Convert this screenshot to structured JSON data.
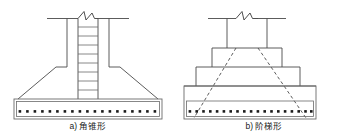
{
  "figure": {
    "colors": {
      "line": "#4a4a4a",
      "line_dark": "#2b2b2b",
      "rebar_dot": "#1a1a1a",
      "background": "#ffffff",
      "text": "#1a1a1a"
    },
    "panels": [
      {
        "id": "panel-a",
        "caption": "a) 角锥形",
        "caption_prefix": "a)",
        "caption_label": "角锥形",
        "type": "tapered-pyramid-footing",
        "parts": {
          "column": "column-with-stirrups",
          "stirrup_count": 8,
          "break_symbol": "zigzag-break",
          "footing": "tapered-sloped-pedestal",
          "base_slab": "rebar-base-slab",
          "rebar_dot_count": 19
        }
      },
      {
        "id": "panel-b",
        "caption": "b) 阶梯形",
        "caption_prefix": "b)",
        "caption_label": "阶梯形",
        "type": "stepped-footing",
        "parts": {
          "column": "plain-column",
          "break_symbol": "zigzag-break",
          "step_count": 3,
          "dashed_slope_guides": 2,
          "base_slab": "rebar-base-slab",
          "rebar_dot_count": 19
        }
      }
    ]
  }
}
